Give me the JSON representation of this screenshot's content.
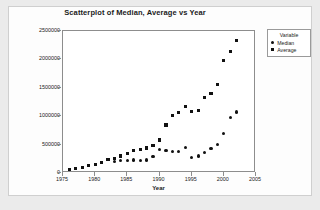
{
  "chart_data": {
    "type": "scatter",
    "title": "Scatterplot of Median, Average vs Year",
    "xlabel": "Year",
    "ylabel": "Salary",
    "xlim": [
      1975,
      2005
    ],
    "ylim": [
      0,
      2500000
    ],
    "xticks": [
      "1975",
      "1980",
      "1985",
      "1990",
      "1995",
      "2000",
      "2005"
    ],
    "xtick_values": [
      1975,
      1980,
      1985,
      1990,
      1995,
      2000,
      2005
    ],
    "yticks": [
      "0",
      "500000",
      "1000000",
      "1500000",
      "2000000",
      "2500000"
    ],
    "ytick_values": [
      0,
      500000,
      1000000,
      1500000,
      2000000,
      2500000
    ],
    "grid": false,
    "legend": {
      "title": "Variable",
      "position": "right-outside",
      "entries": [
        {
          "name": "Median",
          "marker": "circle"
        },
        {
          "name": "Average",
          "marker": "square"
        }
      ]
    },
    "series": [
      {
        "name": "Median",
        "marker": "circle",
        "x": [
          1983,
          1984,
          1985,
          1986,
          1987,
          1988,
          1989,
          1990,
          1991,
          1992,
          1993,
          1994,
          1995,
          1996,
          1997,
          1998,
          1999,
          2000,
          2001,
          2002
        ],
        "y": [
          197000,
          220000,
          220000,
          230000,
          225000,
          230000,
          285000,
          410000,
          395000,
          385000,
          375000,
          455000,
          275000,
          300000,
          365000,
          430000,
          500000,
          700000,
          975000,
          1075000
        ]
      },
      {
        "name": "Average",
        "marker": "square",
        "x": [
          1976,
          1977,
          1978,
          1979,
          1980,
          1981,
          1982,
          1983,
          1984,
          1985,
          1986,
          1987,
          1988,
          1989,
          1990,
          1991,
          1992,
          1993,
          1994,
          1995,
          1996,
          1997,
          1998,
          1999,
          2000,
          2001,
          2002
        ],
        "y": [
          52000,
          76000,
          100000,
          125000,
          150000,
          190000,
          235000,
          250000,
          300000,
          345000,
          400000,
          410000,
          440000,
          490000,
          580000,
          845000,
          1015000,
          1070000,
          1165000,
          1085000,
          1105000,
          1325000,
          1395000,
          1565000,
          1985000,
          2135000,
          2335000
        ]
      }
    ]
  }
}
